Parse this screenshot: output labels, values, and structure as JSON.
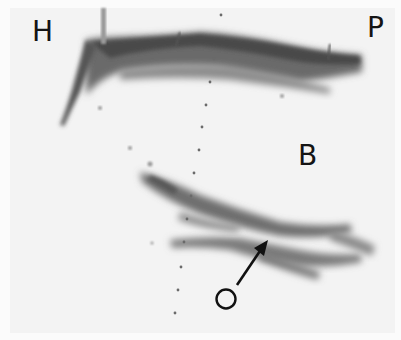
{
  "image": {
    "type": "ultrasound-scan",
    "tone": "grayscale",
    "labels": {
      "top_left": "H",
      "top_right": "P",
      "center": "B",
      "marker": "O"
    },
    "colors": {
      "background": "#f3f3f3",
      "echo_dark": "#2a2a2a",
      "label": "#141414"
    }
  }
}
